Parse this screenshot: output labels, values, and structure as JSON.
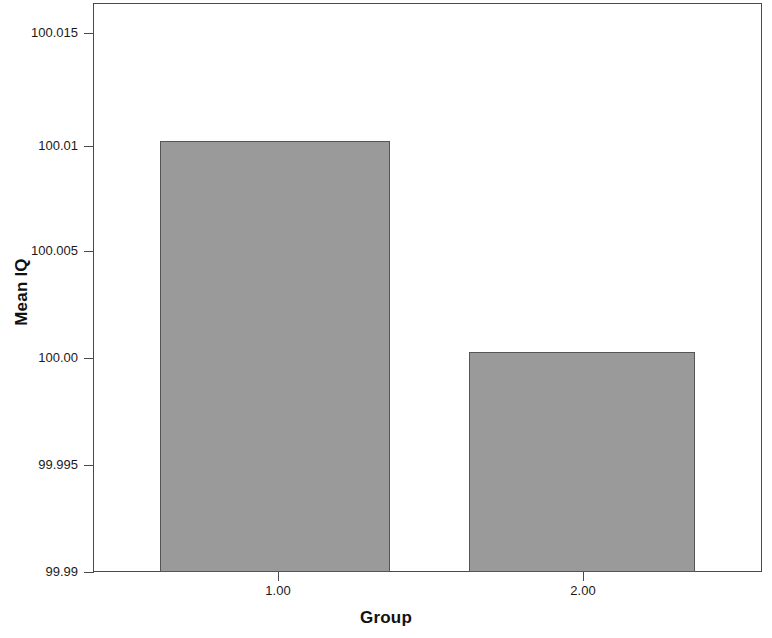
{
  "chart_data": {
    "type": "bar",
    "title": "",
    "xlabel": "Group",
    "ylabel": "Mean IQ",
    "categories": [
      "1.00",
      "2.00"
    ],
    "values": [
      100.01,
      100.0002
    ],
    "series": [
      {
        "name": "Mean IQ",
        "values": [
          100.01,
          100.0002
        ]
      }
    ],
    "ylim": [
      99.99,
      100.0165
    ],
    "ytick_labels": [
      "100.015",
      "100.01",
      "100.005",
      "100.00",
      "99.995",
      "99.99"
    ],
    "ytick_values": [
      100.015,
      100.01,
      100.005,
      100.0,
      99.995,
      99.99
    ],
    "xtick_labels": [
      "1.00",
      "2.00"
    ],
    "grid": false,
    "legend": false,
    "legend_position": "none",
    "bar_color": "#9a9a9a",
    "bar_edge_color": "#555555",
    "axis_color": "#4a4a4a",
    "background": "#ffffff"
  },
  "axes": {
    "y_title": "Mean IQ",
    "x_title": "Group"
  }
}
